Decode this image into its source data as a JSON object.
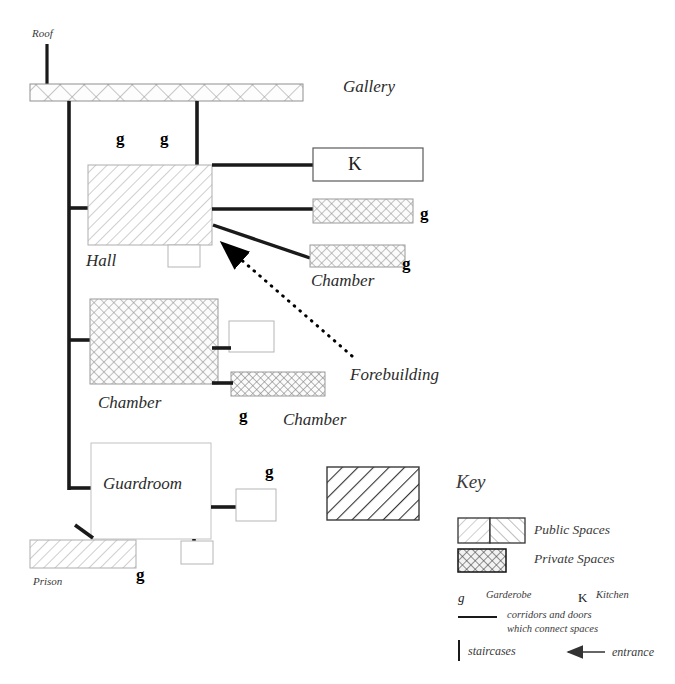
{
  "diagram": {
    "labels": {
      "roof": "Roof",
      "gallery": "Gallery",
      "hall": "Hall",
      "kitchen_mark": "K",
      "chamber_upper_right": "Chamber",
      "chamber_mid_left": "Chamber",
      "chamber_mid_right": "Chamber",
      "forebuilding": "Forebuilding",
      "guardroom": "Guardroom",
      "prison": "Prison"
    },
    "garderobe_marks": [
      {
        "id": "g-hall-left",
        "text": "g"
      },
      {
        "id": "g-hall-right",
        "text": "g"
      },
      {
        "id": "g-chamber-upper-1",
        "text": "g"
      },
      {
        "id": "g-chamber-upper-2",
        "text": "g"
      },
      {
        "id": "g-chamber-mid",
        "text": "g"
      },
      {
        "id": "g-guardroom",
        "text": "g"
      },
      {
        "id": "g-prison",
        "text": "g"
      }
    ],
    "rooms": [
      {
        "id": "gallery-bar",
        "label": "Gallery",
        "fill": "private-large"
      },
      {
        "id": "hall",
        "label": "Hall",
        "fill": "public-light"
      },
      {
        "id": "kitchen-box",
        "label": "K",
        "fill": "none"
      },
      {
        "id": "chamber-upper-1",
        "label": "",
        "fill": "private"
      },
      {
        "id": "chamber-upper-2",
        "label": "Chamber",
        "fill": "private"
      },
      {
        "id": "chamber-mid-left",
        "label": "Chamber",
        "fill": "private"
      },
      {
        "id": "chamber-mid-right",
        "label": "Chamber",
        "fill": "private"
      },
      {
        "id": "forebuilding-box",
        "label": "Forebuilding",
        "fill": "public-bold"
      },
      {
        "id": "guardroom",
        "label": "Guardroom",
        "fill": "none"
      },
      {
        "id": "prison",
        "label": "Prison",
        "fill": "public-light"
      }
    ]
  },
  "key": {
    "title": "Key",
    "public_spaces": "Public Spaces",
    "private_spaces": "Private Spaces",
    "garderobe_symbol": "g",
    "garderobe_label": "Garderobe",
    "kitchen_symbol": "K",
    "kitchen_label": "Kitchen",
    "corridors_line1": "corridors and doors",
    "corridors_line2": "which connect spaces",
    "staircases_label": "staircases",
    "entrance_label": "entrance"
  },
  "colors": {
    "line": "#1a1a1a",
    "text": "#2b2b2b",
    "hatch_light": "#b8b8b8",
    "hatch_dark": "#6b6b6b",
    "box_outline": "#8a8a8a"
  }
}
